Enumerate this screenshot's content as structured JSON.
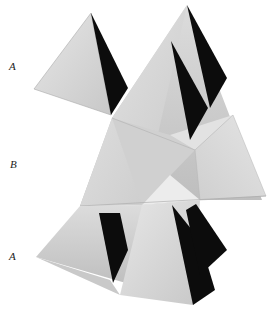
{
  "figure": {
    "labels": [
      {
        "text": "A",
        "x": 9,
        "y": 60
      },
      {
        "text": "B",
        "x": 10,
        "y": 158
      },
      {
        "text": "A",
        "x": 9,
        "y": 250
      }
    ],
    "colors": {
      "background": "#ffffff",
      "light_face": "#d9d9d9",
      "mid_face": "#c4c4c4",
      "pale_face": "#e8e8e8",
      "dark_face": "#0c0c0c"
    }
  }
}
